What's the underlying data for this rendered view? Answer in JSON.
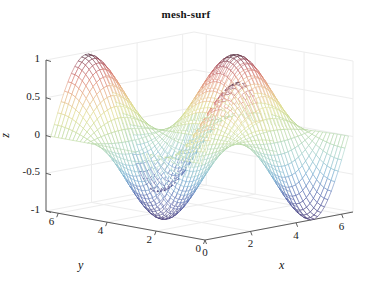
{
  "figure": {
    "title": "mesh-surf",
    "width": 372,
    "height": 295,
    "background": "#ffffff"
  },
  "chart_data": {
    "type": "surface",
    "render": "mesh-wireframe",
    "title": "mesh-surf",
    "xlabel": "x",
    "ylabel": "y",
    "zlabel": "z",
    "xlim": [
      0,
      6.5
    ],
    "ylim": [
      0,
      6.5
    ],
    "zlim": [
      -1,
      1
    ],
    "xticks": [
      0,
      2,
      4,
      6
    ],
    "yticks": [
      0,
      2,
      4,
      6
    ],
    "zticks": [
      -1,
      -0.5,
      0,
      0.5,
      1
    ],
    "xticklabels": [
      "0",
      "2",
      "4",
      "6"
    ],
    "yticklabels": [
      "0",
      "2",
      "4",
      "6"
    ],
    "zticklabels": [
      "-1",
      "-0.5",
      "0",
      "0.5",
      "1"
    ],
    "grid": true,
    "legend": false,
    "colormap": "jet",
    "function": "z = sin(x) * cos(y)",
    "mesh_steps": 42,
    "view_azimuth": -37.5,
    "view_elevation": 30,
    "zvalue_range": [
      -1,
      1
    ]
  },
  "axis_labels": {
    "x": "x",
    "y": "y",
    "z": "z"
  },
  "colors": {
    "axis_line": "#4d4d4d",
    "grid_line": "#ededed",
    "text": "#141414",
    "cmap_low": "#3a2f6e",
    "cmap_mid": "#8fd18c",
    "cmap_high": "#4b2a3c"
  }
}
